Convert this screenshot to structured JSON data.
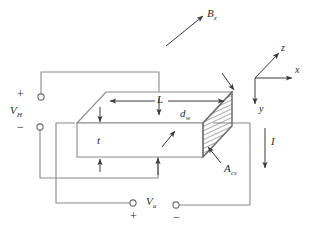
{
  "figure": {
    "stroke_color": "#6b6b6b",
    "text_color": "#2b2b2b",
    "background": "#ffffff",
    "hatch_color": "#4a4a4a"
  },
  "labels": {
    "magnetic_field": {
      "base": "B",
      "sub": "z"
    },
    "length": {
      "base": "L",
      "sub": ""
    },
    "width": {
      "base": "d",
      "sub": "w"
    },
    "thickness": {
      "base": "t",
      "sub": ""
    },
    "cross_section": {
      "base": "A",
      "sub": "cs"
    },
    "hall_voltage": {
      "base": "V",
      "sub": "H"
    },
    "applied_voltage": {
      "base": "V",
      "sub": "a"
    },
    "current": {
      "base": "I",
      "sub": ""
    }
  },
  "axes": {
    "z": "z",
    "x": "x",
    "y": "y"
  },
  "polarity": {
    "hall_plus": "+",
    "hall_minus": "−",
    "applied_plus": "+",
    "applied_minus": "−"
  }
}
